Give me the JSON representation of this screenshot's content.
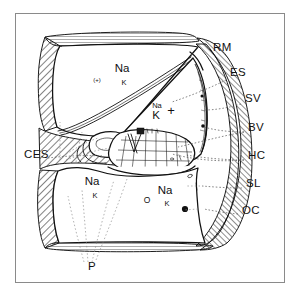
{
  "figure": {
    "frame_color": "#8a8a8a",
    "ink_color": "#111111",
    "background": "#ffffff"
  },
  "side_labels": [
    {
      "id": "RM",
      "text": "RM",
      "meaning": "Reissner's membrane",
      "x": 213,
      "y": 51
    },
    {
      "id": "ES",
      "text": "ES",
      "meaning": "Endolymphatic space",
      "x": 230,
      "y": 76
    },
    {
      "id": "SV",
      "text": "SV",
      "meaning": "Stria vascularis",
      "x": 245,
      "y": 102
    },
    {
      "id": "BV",
      "text": "BV",
      "meaning": "Blood vessel",
      "x": 248,
      "y": 131
    },
    {
      "id": "HC",
      "text": "HC",
      "meaning": "Hair cells",
      "x": 248,
      "y": 159
    },
    {
      "id": "SL",
      "text": "SL",
      "meaning": "Spiral ligament",
      "x": 246,
      "y": 187
    },
    {
      "id": "OC",
      "text": "OC",
      "meaning": "Organ of Corti",
      "x": 242,
      "y": 214
    },
    {
      "id": "CES",
      "text": "CES",
      "meaning": "Cortilymph / extracellular space",
      "x": 24,
      "y": 158
    },
    {
      "id": "P",
      "text": "P",
      "meaning": "Perilymph",
      "x": 88,
      "y": 270
    }
  ],
  "chamber_annotations": [
    {
      "id": "sv-scala-vestibuli",
      "chamber": "scala vestibuli",
      "na": "Na",
      "k": "K",
      "na_x": 122,
      "na_y": 72,
      "k_x": 124,
      "k_y": 85,
      "charge": "(+)",
      "charge_x": 97,
      "charge_y": 82
    },
    {
      "id": "sm-scala-media",
      "chamber": "scala media",
      "na": "Na",
      "k": "K",
      "na_x": 157,
      "na_y": 108,
      "k_x": 156,
      "k_y": 119,
      "charge": "+",
      "charge_x": 171,
      "charge_y": 115
    },
    {
      "id": "st-left",
      "chamber": "scala tympani left",
      "na": "Na",
      "k": "K",
      "na_x": 92,
      "na_y": 185,
      "k_x": 95,
      "k_y": 198
    },
    {
      "id": "st-right",
      "chamber": "scala tympani right",
      "na": "Na",
      "k": "K",
      "na_x": 165,
      "na_y": 194,
      "k_x": 167,
      "k_y": 206,
      "osmotic": "O",
      "osmotic_x": 147,
      "osmotic_y": 203
    }
  ],
  "markers": [
    {
      "id": "blood-vessel-dot",
      "shape": "filled-circle",
      "x": 185,
      "y": 209,
      "r": 3.1
    },
    {
      "id": "tunnel-marker",
      "shape": "filled-square",
      "x": 140,
      "y": 132
    }
  ]
}
